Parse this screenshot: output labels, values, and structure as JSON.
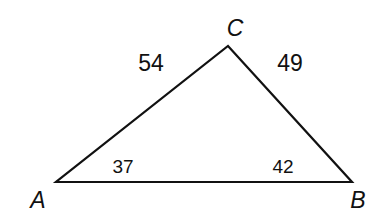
{
  "diagram": {
    "type": "triangle",
    "vertices": {
      "A": {
        "label": "A",
        "x": 56,
        "y": 182
      },
      "B": {
        "label": "B",
        "x": 352,
        "y": 182
      },
      "C": {
        "label": "C",
        "x": 228,
        "y": 46
      }
    },
    "side_labels": {
      "AC": "54",
      "BC": "49"
    },
    "angle_labels": {
      "A": "37",
      "B": "42"
    },
    "stroke_color": "#111111",
    "background": "#ffffff"
  }
}
